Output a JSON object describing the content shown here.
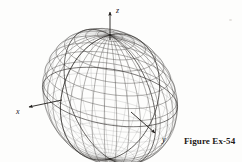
{
  "figure": {
    "caption": "Figure Ex-54",
    "surface_name": "astroidal-sphere-wireframe",
    "equation_label": "x^(2/3) + y^(2/3) + z^(2/3) = a^(2/3)",
    "background_color": "#fdfdfc",
    "ink_color": "#2a2724",
    "mesh_color": "#4a4744",
    "axis_color": "#201d1b"
  },
  "axes": [
    {
      "id": "z",
      "label": "z",
      "label_x": 116,
      "label_y": 7,
      "line": {
        "x1": 110,
        "y1": 40,
        "x2": 110,
        "y2": 12
      },
      "arrow_tip": {
        "x": 110,
        "y": 9
      }
    },
    {
      "id": "x",
      "label": "x",
      "label_x": 16,
      "label_y": 108,
      "line": {
        "x1": 62,
        "y1": 100,
        "x2": 29,
        "y2": 107
      },
      "arrow_tip": {
        "x": 25,
        "y": 108
      }
    },
    {
      "id": "y",
      "label": "y",
      "label_x": 162,
      "label_y": 136,
      "line": {
        "x1": 131,
        "y1": 112,
        "x2": 155,
        "y2": 133
      },
      "arrow_tip": {
        "x": 159,
        "y": 137
      }
    }
  ],
  "surface": {
    "type": "astroid-star-surface",
    "center": {
      "x": 110,
      "y": 97
    },
    "cusps": [
      {
        "name": "top-cusp-z",
        "x": 110,
        "y": 40
      },
      {
        "name": "bottom-cusp",
        "x": 110,
        "y": 146
      },
      {
        "name": "left-cusp-x",
        "x": 50,
        "y": 104
      },
      {
        "name": "right-cusp-y",
        "x": 167,
        "y": 71
      },
      {
        "name": "upper-left-cusp",
        "x": 75,
        "y": 55
      },
      {
        "name": "lower-right-cusp",
        "x": 146,
        "y": 122
      }
    ],
    "mesh_u_lines": 17,
    "mesh_v_lines": 17
  },
  "chart_data": {
    "type": "line",
    "title": "Figure Ex-54",
    "xlabel": "x",
    "ylabel": "y",
    "zlabel": "z",
    "grid": false,
    "legend": "none",
    "axis_labels": [
      "x",
      "y",
      "z"
    ],
    "surface_equation_exponent": 0.6666666667,
    "radius": 1,
    "mesh_resolution": [
      17,
      17
    ]
  }
}
